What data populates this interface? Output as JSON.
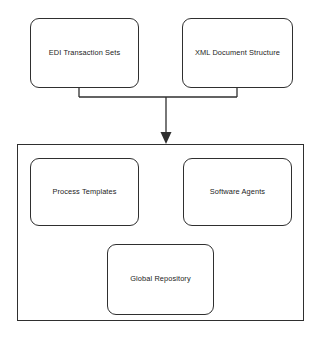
{
  "diagram": {
    "type": "block-diagram",
    "background_color": "#ffffff",
    "stroke_color": "#2f2f2f",
    "text_color": "#1c1c1c",
    "sources": [
      {
        "id": "edi",
        "label": "EDI Transaction Sets"
      },
      {
        "id": "xml",
        "label": "XML Document Structure"
      }
    ],
    "container": {
      "id": "system",
      "label": "",
      "children": [
        {
          "id": "process",
          "label": "Process Templates"
        },
        {
          "id": "agents",
          "label": "Software Agents"
        },
        {
          "id": "repository",
          "label": "Global Repository"
        }
      ]
    },
    "connectors": [
      {
        "from": "edi",
        "to": "system",
        "style": "elbow-merge",
        "arrowhead": true
      },
      {
        "from": "xml",
        "to": "system",
        "style": "elbow-merge",
        "arrowhead": true
      }
    ]
  }
}
